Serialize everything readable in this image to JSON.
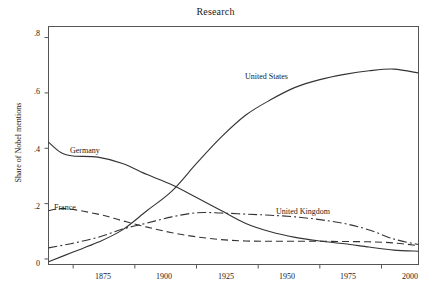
{
  "chart_data": {
    "type": "line",
    "title": "Research",
    "xlabel": "",
    "ylabel": "Share of Nobel mentions",
    "xlim": [
      1865,
      2015
    ],
    "ylim": [
      -0.02,
      0.84
    ],
    "grid": false,
    "legend": "inline-labels",
    "xticks": [
      "1875",
      "1900",
      "1925",
      "1950",
      "1975",
      "2000"
    ],
    "xtick_values": [
      1875,
      1900,
      1925,
      1950,
      1975,
      2000
    ],
    "yticks": [
      "0",
      ".2",
      ".4",
      ".6",
      ".8"
    ],
    "ytick_values": [
      0,
      0.2,
      0.4,
      0.6,
      0.8
    ],
    "series": [
      {
        "name": "United States",
        "label": "United States",
        "style": "solid",
        "x": [
          1865,
          1875,
          1885,
          1895,
          1905,
          1915,
          1925,
          1935,
          1945,
          1955,
          1965,
          1975,
          1985,
          1995,
          2005,
          2015
        ],
        "values": [
          -0.01,
          0.025,
          0.06,
          0.105,
          0.175,
          0.245,
          0.345,
          0.44,
          0.52,
          0.575,
          0.62,
          0.648,
          0.667,
          0.68,
          0.686,
          0.672
        ]
      },
      {
        "name": "Germany",
        "label": "Germany",
        "style": "solid",
        "x": [
          1865,
          1870,
          1875,
          1885,
          1895,
          1905,
          1915,
          1925,
          1935,
          1945,
          1955,
          1965,
          1975,
          1985,
          1995,
          2005,
          2015
        ],
        "values": [
          0.422,
          0.385,
          0.372,
          0.368,
          0.345,
          0.305,
          0.268,
          0.222,
          0.175,
          0.128,
          0.098,
          0.078,
          0.065,
          0.055,
          0.043,
          0.032,
          0.028
        ]
      },
      {
        "name": "France",
        "label": "France",
        "style": "dashed",
        "x": [
          1865,
          1872,
          1885,
          1895,
          1905,
          1915,
          1925,
          1935,
          1945,
          1955,
          1965,
          1975,
          1985,
          1995,
          2005,
          2015
        ],
        "values": [
          0.175,
          0.182,
          0.162,
          0.138,
          0.115,
          0.095,
          0.08,
          0.07,
          0.065,
          0.064,
          0.064,
          0.064,
          0.063,
          0.062,
          0.058,
          0.048
        ]
      },
      {
        "name": "United Kingdom",
        "label": "United Kingdom",
        "style": "dash-dot",
        "x": [
          1865,
          1875,
          1885,
          1895,
          1905,
          1915,
          1925,
          1935,
          1945,
          1955,
          1965,
          1975,
          1985,
          1995,
          2005,
          2015
        ],
        "values": [
          0.04,
          0.057,
          0.078,
          0.108,
          0.13,
          0.152,
          0.167,
          0.166,
          0.162,
          0.158,
          0.152,
          0.142,
          0.128,
          0.105,
          0.072,
          0.052
        ]
      }
    ]
  },
  "labels": {
    "united_states": "United States",
    "germany": "Germany",
    "france": "France",
    "united_kingdom": "United Kingdom"
  }
}
